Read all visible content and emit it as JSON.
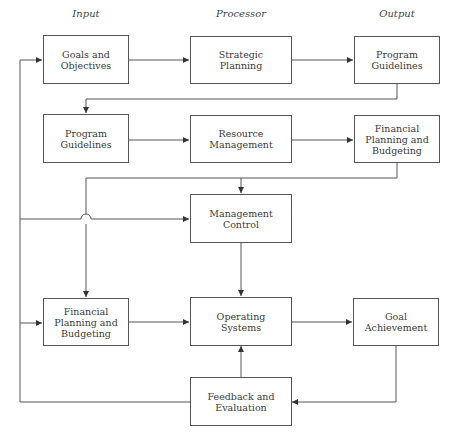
{
  "columns": {
    "input": "Input",
    "processor": "Processor",
    "output": "Output"
  },
  "boxes": {
    "goals_objectives": "Goals and\nObjectives",
    "strategic_planning": "Strategic\nPlanning",
    "program_guidelines_output": "Program\nGuidelines",
    "program_guidelines_input": "Program\nGuidelines",
    "resource_management": "Resource\nManagement",
    "financial_planning_output": "Financial\nPlanning and\nBudgeting",
    "management_control": "Management\nControl",
    "financial_planning_input": "Financial\nPlanning and\nBudgeting",
    "operating_systems": "Operating\nSystems",
    "goal_achievement": "Goal\nAchievement",
    "feedback_evaluation": "Feedback and\nEvaluation"
  },
  "colors": {
    "line": "#555555",
    "text": "#3a3a3a",
    "background": "#ffffff"
  }
}
